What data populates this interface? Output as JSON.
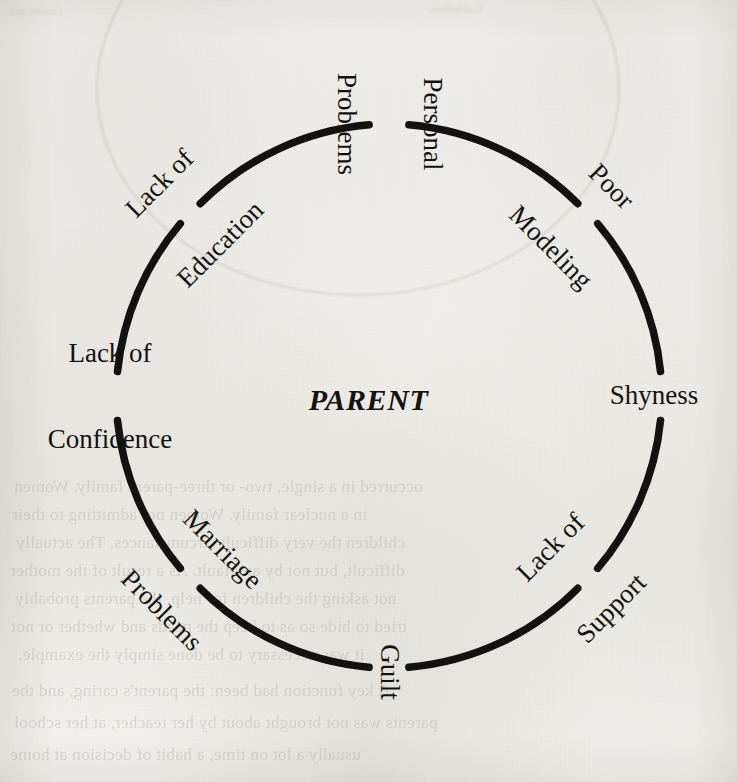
{
  "figure": {
    "type": "cycle-diagram",
    "center_label": "PARENT",
    "shape": "circle",
    "stroke_color": "#141210",
    "background_color": "#f2f1ee",
    "nodes": [
      {
        "id": "personal-problems",
        "label_line1": "Personal",
        "label_line2": "Problems",
        "position": "top",
        "angle_deg": 0,
        "rotation_deg": 90,
        "lines": 2
      },
      {
        "id": "poor-modeling",
        "label_line1": "Poor",
        "label_line2": "Modeling",
        "position": "top-right",
        "angle_deg": 45,
        "rotation_deg": 45,
        "lines": 2
      },
      {
        "id": "shyness",
        "label_line1": "Shyness",
        "label_line2": "",
        "position": "right",
        "angle_deg": 90,
        "rotation_deg": 0,
        "lines": 1
      },
      {
        "id": "lack-of-support",
        "label_line1": "Lack of",
        "label_line2": "Support",
        "position": "bottom-right",
        "angle_deg": 135,
        "rotation_deg": -45,
        "lines": 2
      },
      {
        "id": "guilt",
        "label_line1": "Guilt",
        "label_line2": "",
        "position": "bottom",
        "angle_deg": 180,
        "rotation_deg": 90,
        "lines": 1
      },
      {
        "id": "marriage-problems",
        "label_line1": "Marriage",
        "label_line2": "Problems",
        "position": "bottom-left",
        "angle_deg": 225,
        "rotation_deg": 45,
        "lines": 2
      },
      {
        "id": "lack-of-confidence",
        "label_line1": "Lack of",
        "label_line2": "Confidence",
        "position": "left",
        "angle_deg": 270,
        "rotation_deg": 0,
        "lines": 2
      },
      {
        "id": "lack-of-education",
        "label_line1": "Lack of",
        "label_line2": "Education",
        "position": "top-left",
        "angle_deg": 315,
        "rotation_deg": -45,
        "lines": 2
      }
    ]
  },
  "page_background": {
    "description": "faint mirrored show-through text from the reverse side of the scanned book page",
    "top_fragments": [
      "Guidelines"
    ],
    "upper_lines": [
      ""
    ],
    "middle_lines": [
      "occurred in a single, two- or three-parent family. Women",
      "in a nuclear family. Women not admitting to their",
      "children the very difficult circumstances. The actually",
      "difficult, but not by any fault. As a result of the mother",
      "not asking the children for help, the parents probably",
      "tried to hide so as to keep the needs and whether or not",
      "it was necessary to be done simply the example."
    ],
    "lower_lines": [
      "A key function had been: the parent's caring, and the",
      "parents was not brought about by her teacher, at her school",
      "usually a lot on time, a habit of decision at home"
    ]
  }
}
